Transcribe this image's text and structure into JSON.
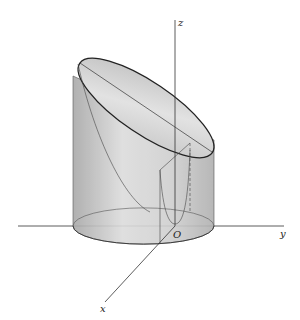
{
  "figure": {
    "axes": {
      "x_label": "x",
      "y_label": "y",
      "z_label": "z",
      "origin_label": "O"
    },
    "colors": {
      "surface_light": "#e6e6e6",
      "surface_dark": "#9a9a9a",
      "line": "#222222",
      "background": "#ffffff"
    }
  }
}
